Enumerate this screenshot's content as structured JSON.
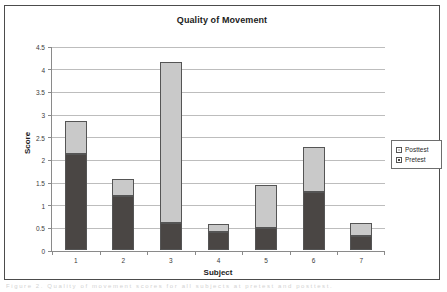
{
  "chart_data": {
    "type": "bar",
    "stacked": true,
    "title": "Quality of Movement",
    "xlabel": "Subject",
    "ylabel": "Score",
    "categories": [
      "1",
      "2",
      "3",
      "4",
      "5",
      "6",
      "7"
    ],
    "series": [
      {
        "name": "Pretest",
        "color": "#4a4644",
        "values": [
          2.12,
          1.2,
          0.6,
          0.4,
          0.49,
          1.29,
          0.3
        ]
      },
      {
        "name": "Posttest",
        "color": "#c9c9c9",
        "values": [
          0.73,
          0.36,
          3.55,
          0.18,
          0.94,
          0.99,
          0.3
        ]
      }
    ],
    "totals": [
      2.85,
      1.56,
      4.15,
      0.58,
      1.43,
      2.28,
      0.6
    ],
    "ylim": [
      0,
      4.5
    ],
    "yticks": [
      "0",
      "0.5",
      "1",
      "1.5",
      "2",
      "2.5",
      "3",
      "3.5",
      "4",
      "4.5"
    ],
    "ytick_values": [
      0,
      0.5,
      1,
      1.5,
      2,
      2.5,
      3,
      3.5,
      4,
      4.5
    ],
    "grid": true,
    "legend_position": "right",
    "legend_entries": [
      "Posttest",
      "Pretest"
    ]
  },
  "footer": {
    "page_text": "Figure 2.  Quality of movement scores for all subjects at pretest and posttest."
  }
}
